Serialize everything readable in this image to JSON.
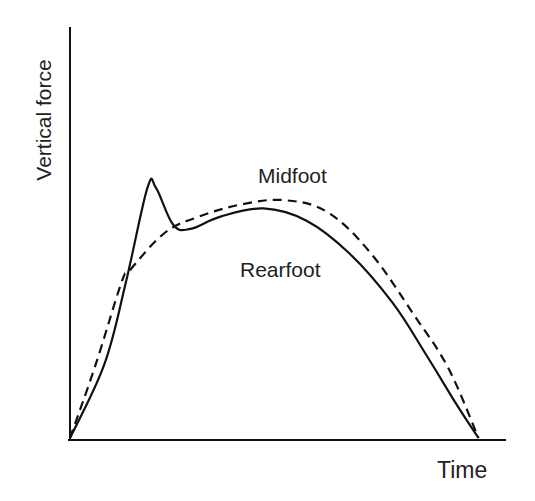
{
  "chart_data": {
    "type": "line",
    "title": "",
    "xlabel": "Time",
    "ylabel": "Vertical force",
    "grid": false,
    "legend": "inline labels",
    "axis_ticks": "none",
    "xlim": [
      0,
      100
    ],
    "ylim": [
      0,
      100
    ],
    "series": [
      {
        "name": "Rearfoot",
        "style": "solid",
        "points": [
          [
            0,
            0
          ],
          [
            8,
            18
          ],
          [
            13,
            38
          ],
          [
            18,
            61
          ],
          [
            20,
            61
          ],
          [
            24,
            52
          ],
          [
            28,
            51
          ],
          [
            35,
            54
          ],
          [
            45,
            56
          ],
          [
            55,
            53
          ],
          [
            65,
            45
          ],
          [
            75,
            33
          ],
          [
            83,
            20
          ],
          [
            90,
            8
          ],
          [
            95,
            0
          ]
        ]
      },
      {
        "name": "Midfoot",
        "style": "dashed",
        "points": [
          [
            0,
            0
          ],
          [
            6,
            18
          ],
          [
            12,
            38
          ],
          [
            14,
            41
          ],
          [
            22,
            50
          ],
          [
            30,
            54
          ],
          [
            40,
            57
          ],
          [
            50,
            58
          ],
          [
            60,
            55
          ],
          [
            70,
            45
          ],
          [
            80,
            30
          ],
          [
            88,
            17
          ],
          [
            95,
            0
          ]
        ]
      }
    ],
    "annotations": [
      {
        "text": "Midfoot",
        "near": "dashed curve peak"
      },
      {
        "text": "Rearfoot",
        "near": "below solid curve"
      }
    ]
  },
  "labels": {
    "y_axis": "Vertical force",
    "x_axis": "Time",
    "midfoot": "Midfoot",
    "rearfoot": "Rearfoot"
  }
}
